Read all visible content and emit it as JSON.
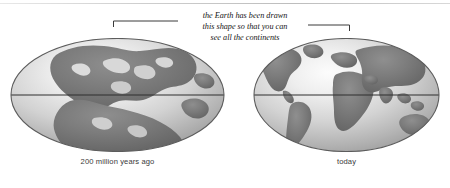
{
  "figure": {
    "annotation": {
      "lines": [
        "the Earth has been drawn",
        "this shape so that you can",
        "see all the continents"
      ]
    },
    "globes": [
      {
        "id": "past",
        "caption": "200 million years ago",
        "land_label": "Pangaea supercontinent",
        "equator": true
      },
      {
        "id": "today",
        "caption": "today",
        "land_label": "modern continents",
        "equator": true
      }
    ],
    "colors": {
      "ocean_light": "#e9e9e9",
      "ocean_mid": "#c9c9c9",
      "ocean_dark": "#9e9e9e",
      "land": "#767676",
      "land_dark": "#6a6a6a",
      "outline": "#5c5c5c",
      "equator": "#2f2f2f",
      "leader_line": "#3a3a3a",
      "text": "#151515",
      "caption_text": "#3a3a3a",
      "background": "#ffffff"
    }
  }
}
